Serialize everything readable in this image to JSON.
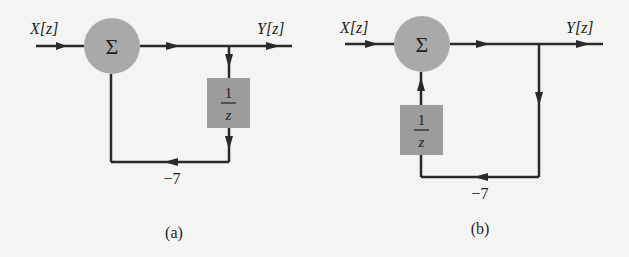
{
  "diagrams": [
    {
      "id": "a",
      "caption": "(a)",
      "input_label": "X[z]",
      "output_label": "Y[z]",
      "summer_symbol": "Σ",
      "delay_block": {
        "numerator": "1",
        "denominator": "z"
      },
      "feedback_gain": "−7"
    },
    {
      "id": "b",
      "caption": "(b)",
      "input_label": "X[z]",
      "output_label": "Y[z]",
      "summer_symbol": "Σ",
      "delay_block": {
        "numerator": "1",
        "denominator": "z"
      },
      "feedback_gain": "−7"
    }
  ],
  "colors": {
    "line": "#2a2a2a",
    "summer_fill": "#a9a9a9",
    "block_fill": "#9c9c9c",
    "background": "#f4f4f2"
  }
}
